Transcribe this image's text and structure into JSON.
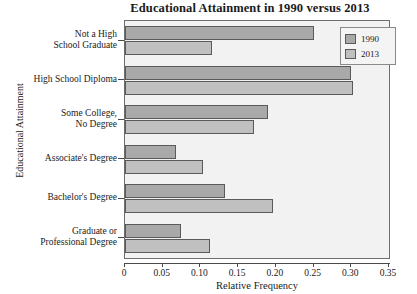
{
  "chart_data": {
    "type": "bar",
    "orientation": "horizontal",
    "title": "Educational Attainment in 1990 versus 2013",
    "xlabel": "Relative Frequency",
    "ylabel": "Educational Attainment",
    "xlim": [
      0,
      0.35
    ],
    "xticks": [
      "0",
      "0.05",
      "0.10",
      "0.15",
      "0.20",
      "0.25",
      "0.30",
      "0.35"
    ],
    "xtick_values": [
      0,
      0.05,
      0.1,
      0.15,
      0.2,
      0.25,
      0.3,
      0.35
    ],
    "grid": false,
    "legend_position": "top-right",
    "categories": [
      "Not a High\nSchool Graduate",
      "High School Diploma",
      "Some College,\nNo Degree",
      "Associate's Degree",
      "Bachelor's Degree",
      "Graduate or\nProfessional Degree"
    ],
    "category_lines": [
      [
        "Not a High",
        "School Graduate"
      ],
      [
        "High School Diploma"
      ],
      [
        "Some College,",
        "No Degree"
      ],
      [
        "Associate's Degree"
      ],
      [
        "Bachelor's Degree"
      ],
      [
        "Graduate or",
        "Professional Degree"
      ]
    ],
    "series": [
      {
        "name": "1990",
        "color": "#a9a9a9",
        "values": [
          0.25,
          0.3,
          0.19,
          0.067,
          0.133,
          0.074
        ]
      },
      {
        "name": "2013",
        "color": "#c0c0c0",
        "values": [
          0.115,
          0.302,
          0.171,
          0.103,
          0.196,
          0.113
        ]
      }
    ]
  },
  "legend": {
    "entries": [
      {
        "label": "1990"
      },
      {
        "label": "2013"
      }
    ]
  },
  "colors": {
    "series_1990": "#a9a9a9",
    "series_2013": "#c0c0c0",
    "plot_background": "#f2f2f2",
    "axis": "#4a4a4a",
    "bar_border": "#5a5a5a"
  }
}
